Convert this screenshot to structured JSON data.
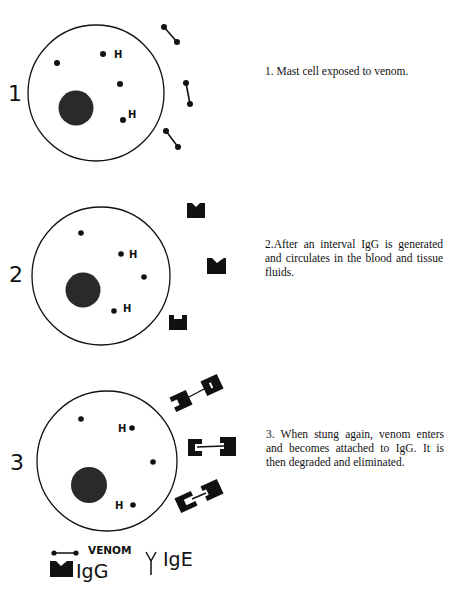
{
  "stages": [
    {
      "number": "1",
      "caption": "1. Mast cell exposed to venom.",
      "h_label": "H"
    },
    {
      "number": "2",
      "caption": "2.After an interval IgG is generated and circulates in the blood and tissue fluids.",
      "h_label": "H"
    },
    {
      "number": "3",
      "caption": "3. When stung again, venom enters and becomes attached to IgG. It is then degraded and eliminated.",
      "h_label": "H"
    }
  ],
  "legend": {
    "venom": "VENOM",
    "igg": "IgG",
    "ige": "IgE"
  },
  "colors": {
    "ink": "#111111",
    "nucleus": "#2a2a2a",
    "background": "#ffffff"
  }
}
